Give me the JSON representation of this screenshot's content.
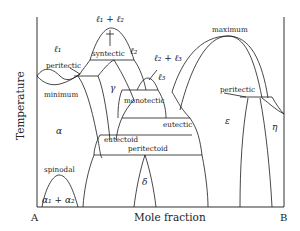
{
  "diagram": {
    "type": "binary phase diagram",
    "axes": {
      "y_label": "Temperature",
      "x_label": "Mole fraction",
      "left_end": "A",
      "right_end": "B"
    },
    "phases": {
      "l1": "ℓ₁",
      "l2": "ℓ₂",
      "l3": "ℓ₃",
      "l1_l2": "ℓ₁ + ℓ₂",
      "l2_l3": "ℓ₂ + ℓ₃",
      "alpha": "α",
      "gamma": "γ",
      "delta": "δ",
      "epsilon": "ε",
      "eta": "η",
      "alpha1_alpha2": "α₁ + α₂"
    },
    "labels": {
      "peritectic_left": "peritectic",
      "minimum": "minimum",
      "syntectic": "syntectic",
      "monotectic": "monotectic",
      "eutectic": "eutectic",
      "eutectoid": "eutectoid",
      "peritectoid": "peritectoid",
      "spinodal": "spinodal",
      "maximum": "maximum",
      "peritectic_right": "peritectic"
    }
  }
}
